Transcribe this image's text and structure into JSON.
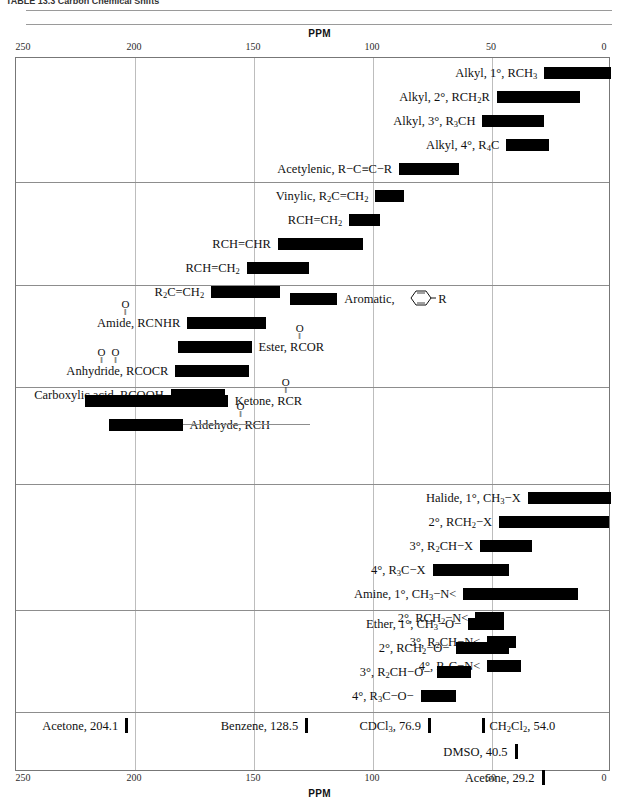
{
  "title": "TABLE 13.3   Carbon Chemical Shifts",
  "axis": {
    "label": "PPM",
    "ticks": [
      250,
      200,
      150,
      100,
      50,
      0
    ],
    "min_ppm": 0,
    "max_ppm": 250,
    "direction": "reversed"
  },
  "chart_data": {
    "type": "bar",
    "orientation": "horizontal-range",
    "title": "Carbon Chemical Shifts",
    "xlabel": "PPM",
    "ylabel": "",
    "xlim": [
      250,
      0
    ],
    "grid": true,
    "legend": "none",
    "groups": [
      {
        "name": "alkyl-and-acetylenic",
        "rows": [
          {
            "label": "Alkyl, 1°, RCH3",
            "label_html": "Alkyl, 1&deg;, RCH<sub>3</sub>",
            "start_ppm": 28,
            "end_ppm": 0
          },
          {
            "label": "Alkyl, 2°, RCH2R",
            "label_html": "Alkyl, 2&deg;, RCH<sub>2</sub>R",
            "start_ppm": 48,
            "end_ppm": 13
          },
          {
            "label": "Alkyl, 3°, R3CH",
            "label_html": "Alkyl, 3&deg;, R<sub>3</sub>CH",
            "start_ppm": 54,
            "end_ppm": 28
          },
          {
            "label": "Alkyl, 4°, R4C",
            "label_html": "Alkyl, 4&deg;, R<sub>4</sub>C",
            "start_ppm": 44,
            "end_ppm": 26
          },
          {
            "label": "Acetylenic, R−C≡C−R",
            "label_html": "Acetylenic, R&#8722;C&#8801;C&#8722;R",
            "start_ppm": 89,
            "end_ppm": 64
          }
        ]
      },
      {
        "name": "alkenes",
        "rows": [
          {
            "label": "Vinylic, R2C=CH2",
            "label_html": "Vinylic, R<sub>2</sub>C=CH<sub>2</sub>",
            "start_ppm": 99,
            "end_ppm": 87
          },
          {
            "label": "RCH=CH2",
            "label_html": "RCH=CH<sub>2</sub>",
            "start_ppm": 110,
            "end_ppm": 97
          },
          {
            "label": "RCH=CHR",
            "label_html": "RCH=CHR",
            "start_ppm": 140,
            "end_ppm": 104
          },
          {
            "label": "RCH=CH2",
            "label_html": "RCH=CH<sub>2</sub>",
            "start_ppm": 153,
            "end_ppm": 127
          },
          {
            "label": "R2C=CH2",
            "label_html": "R<sub>2</sub>C=CH<sub>2</sub>",
            "start_ppm": 168,
            "end_ppm": 139
          }
        ]
      },
      {
        "name": "aromatic-and-acyl",
        "rows": [
          {
            "label": "Aromatic, C6H5−R",
            "label_html": "Aromatic,",
            "start_ppm": 135,
            "end_ppm": 115,
            "label_side": "right",
            "icon": "benzene-ring"
          },
          {
            "label": "Amide, RCONHR",
            "label_html": "Amide, RCNHR",
            "start_ppm": 178,
            "end_ppm": 145,
            "carbonyl_over": "RC"
          },
          {
            "label": "Ester, RCOOR",
            "label_html": "Ester, RCOR",
            "start_ppm": 182,
            "end_ppm": 151,
            "label_side": "right",
            "carbonyl_over": "RC"
          },
          {
            "label": "Anhydride, RCOOCR",
            "label_html": "Anhydride, RCOCR",
            "start_ppm": 183,
            "end_ppm": 152,
            "carbonyl_over": "double"
          },
          {
            "label": "Carboxylic acid, RCOOH",
            "label_html": "Carboxylic acid, RCOOH",
            "start_ppm": 185,
            "end_ppm": 162
          }
        ]
      },
      {
        "name": "ketone-aldehyde",
        "rows": [
          {
            "label": "Ketone, RCOR",
            "label_html": "Ketone, RCR",
            "start_ppm": 221,
            "end_ppm": 161,
            "label_side": "right",
            "carbonyl_over": "RC"
          },
          {
            "label": "Aldehyde, RCHO",
            "label_html": "Aldehyde, RCH",
            "start_ppm": 211,
            "end_ppm": 180,
            "label_side": "right",
            "leader": true,
            "carbonyl_over": "RC"
          }
        ]
      },
      {
        "name": "halides-and-amines",
        "rows": [
          {
            "label": "Halide, 1°, CH3−X",
            "label_html": "Halide, 1&deg;, CH<sub>3</sub>&#8722;X",
            "start_ppm": 35,
            "end_ppm": 0
          },
          {
            "label": "2°, RCH2−X",
            "label_html": "2&deg;, RCH<sub>2</sub>&#8722;X",
            "start_ppm": 47,
            "end_ppm": 1
          },
          {
            "label": "3°, R2CH−X",
            "label_html": "3&deg;, R<sub>2</sub>CH&#8722;X",
            "start_ppm": 55,
            "end_ppm": 33
          },
          {
            "label": "4°, R3C−X",
            "label_html": "4&deg;, R<sub>3</sub>C&#8722;X",
            "start_ppm": 75,
            "end_ppm": 43
          },
          {
            "label": "Amine, 1°, CH3−N<",
            "label_html": "Amine, 1&deg;, CH<sub>3</sub>&#8722;N&lt;",
            "start_ppm": 62,
            "end_ppm": 14
          },
          {
            "label": "2°, RCH2−N<",
            "label_html": "2&deg;, RCH<sub>2</sub>&#8722;N&lt;",
            "start_ppm": 57,
            "end_ppm": 45
          },
          {
            "label": "3°, R2CH−N<",
            "label_html": "3&deg;, R<sub>2</sub>CH&#8722;N&lt;",
            "start_ppm": 52,
            "end_ppm": 40
          },
          {
            "label": "4°, R3C−N<",
            "label_html": "4&deg;, R<sub>3</sub>C&#8722;N&lt;",
            "start_ppm": 52,
            "end_ppm": 38
          }
        ]
      },
      {
        "name": "ethers",
        "rows": [
          {
            "label": "Ether, 1°, CH3−O−",
            "label_html": "Ether, 1&deg;, CH<sub>3</sub>&#8722;O&#8722;",
            "start_ppm": 60,
            "end_ppm": 45
          },
          {
            "label": "2°, RCH2−O−",
            "label_html": "2&deg;, RCH<sub>2</sub>&#8722;O&#8722;",
            "start_ppm": 65,
            "end_ppm": 43
          },
          {
            "label": "3°, R2CH−O−",
            "label_html": "3&deg;, R<sub>2</sub>CH&#8722;O&#8722;",
            "start_ppm": 73,
            "end_ppm": 59
          },
          {
            "label": "4°, R3C−O−",
            "label_html": "4&deg;, R<sub>3</sub>C&#8722;O&#8722;",
            "start_ppm": 80,
            "end_ppm": 65
          }
        ]
      }
    ],
    "solvent_references": [
      {
        "label": "Acetone, 204.1",
        "label_html": "Acetone, 204.1",
        "ppm": 204.1,
        "row": 0
      },
      {
        "label": "Benzene, 128.5",
        "label_html": "Benzene, 128.5",
        "ppm": 128.5,
        "row": 0
      },
      {
        "label": "CDCl3, 76.9",
        "label_html": "CDCl<sub>3</sub>, 76.9",
        "ppm": 76.9,
        "row": 0
      },
      {
        "label": "CH2Cl2, 54.0",
        "label_html": "CH<sub>2</sub>Cl<sub>2</sub>, 54.0",
        "ppm": 54.0,
        "row": 0,
        "label_side": "right"
      },
      {
        "label": "DMSO, 40.5",
        "label_html": "DMSO, 40.5",
        "ppm": 40.5,
        "row": 1
      },
      {
        "label": "Acetone, 29.2",
        "label_html": "Acetone, 29.2",
        "ppm": 29.2,
        "row": 2
      }
    ]
  },
  "colors": {
    "bar": "#000000",
    "grid": "#bdbdbd",
    "separator": "#8d8d8d",
    "frame": "#777777",
    "text": "#111111",
    "background": "#ffffff"
  }
}
